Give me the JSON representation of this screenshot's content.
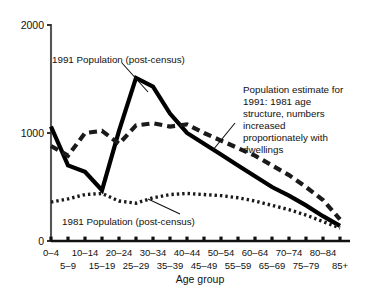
{
  "chart_data": {
    "type": "line",
    "title": "",
    "xlabel": "Age group",
    "ylabel": "",
    "ylim": [
      0,
      2000
    ],
    "yticks": [
      0,
      1000,
      2000
    ],
    "ytick_labels": [
      "0",
      "1000",
      "2000"
    ],
    "grid": false,
    "legend_position": "inline-annotations",
    "categories": [
      "0–4",
      "5–9",
      "10–14",
      "15–19",
      "20–24",
      "25–29",
      "30–34",
      "35–39",
      "40–44",
      "45–49",
      "50–54",
      "55–59",
      "60–64",
      "65–69",
      "70–74",
      "75–79",
      "80–84",
      "85+"
    ],
    "categories_row_top": [
      "0–4",
      "",
      "10–14",
      "",
      "20–24",
      "",
      "30–34",
      "",
      "40–44",
      "",
      "50–54",
      "",
      "60–64",
      "",
      "70–74",
      "",
      "80–84",
      ""
    ],
    "categories_row_bottom": [
      "",
      "5–9",
      "",
      "15–19",
      "",
      "25–29",
      "",
      "35–39",
      "",
      "45–49",
      "",
      "55–59",
      "",
      "65–69",
      "",
      "75–79",
      "",
      "85+"
    ],
    "series": [
      {
        "name": "1991 Population (post-census)",
        "style": "solid",
        "values": [
          1060,
          700,
          640,
          470,
          1020,
          1510,
          1430,
          1180,
          1000,
          900,
          800,
          700,
          600,
          500,
          420,
          330,
          230,
          140
        ]
      },
      {
        "name": "Population estimate for 1991: 1981 age structure, numbers increased proportionately with dwellings",
        "style": "dashed",
        "values": [
          880,
          790,
          1000,
          1020,
          900,
          1070,
          1090,
          1060,
          1080,
          1000,
          930,
          860,
          790,
          700,
          610,
          500,
          380,
          200
        ]
      },
      {
        "name": "1981 Population (post-census)",
        "style": "dotted",
        "values": [
          360,
          390,
          430,
          440,
          370,
          350,
          400,
          430,
          440,
          430,
          420,
          400,
          370,
          330,
          290,
          240,
          180,
          120
        ]
      }
    ],
    "annotations": [
      {
        "id": "anno-1991-postcensus",
        "lines": [
          "1991 Population (post-census)"
        ],
        "text": "1991 Population (post-census)"
      },
      {
        "id": "anno-1991-estimate",
        "lines": [
          "Population estimate for",
          "1991: 1981 age",
          "structure, numbers",
          "increased",
          "proportionately with",
          "dwellings"
        ],
        "text": "Population estimate for 1991: 1981 age structure, numbers increased proportionately with dwellings"
      },
      {
        "id": "anno-1981-postcensus",
        "lines": [
          "1981 Population (post-census)"
        ],
        "text": "1981 Population (post-census)"
      }
    ],
    "colors": {
      "ink": "#111111",
      "background": "#ffffff",
      "series_1991": "#000000",
      "series_estimate": "#1a1a1a",
      "series_1981": "#1a1a1a"
    }
  }
}
